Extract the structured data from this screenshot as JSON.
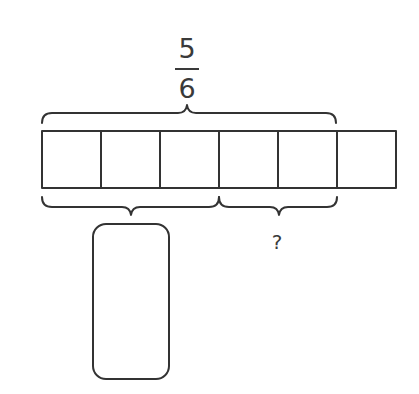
{
  "diagram": {
    "type": "tape-diagram",
    "total_label": {
      "numerator": "5",
      "denominator": "6"
    },
    "tape": {
      "segments": 6,
      "bracketed_total_segments": 5
    },
    "lower_left_bracket": {
      "segments": 3,
      "answer_box_value": ""
    },
    "lower_right_bracket": {
      "segments": 2,
      "label": "?"
    },
    "colors": {
      "stroke": "#333333",
      "background": "#ffffff"
    }
  }
}
